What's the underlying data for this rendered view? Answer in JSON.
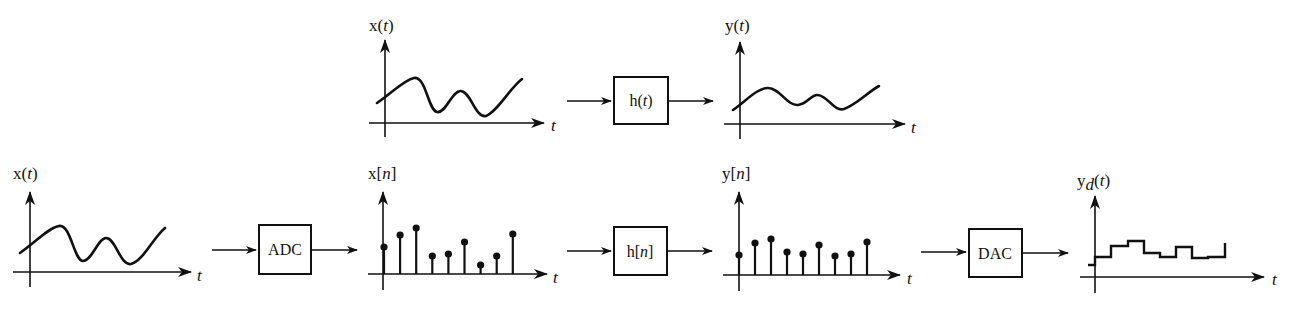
{
  "top_row": {
    "input": {
      "label_main": "x(",
      "label_var": "t",
      "label_close": ")",
      "axis_label": "t"
    },
    "system": {
      "label_main": "h(",
      "label_var": "t",
      "label_close": ")"
    },
    "output": {
      "label_main": "y(",
      "label_var": "t",
      "label_close": ")",
      "axis_label": "t"
    }
  },
  "bottom_row": {
    "input": {
      "label_main": "x(",
      "label_var": "t",
      "label_close": ")",
      "axis_label": "t"
    },
    "adc": {
      "label": "ADC"
    },
    "sampled": {
      "label_main": "x[",
      "label_var": "n",
      "label_close": "]",
      "axis_label": "t",
      "samples": [
        0.27,
        0.39,
        0.46,
        0.18,
        0.2,
        0.32,
        0.09,
        0.18,
        0.4
      ]
    },
    "system": {
      "label_main": "h[",
      "label_var": "n",
      "label_close": "]"
    },
    "filtered": {
      "label_main": "y[",
      "label_var": "n",
      "label_close": "]",
      "axis_label": "t",
      "samples": [
        0.2,
        0.32,
        0.36,
        0.23,
        0.21,
        0.3,
        0.19,
        0.21,
        0.33
      ]
    },
    "dac": {
      "label": "DAC"
    },
    "output": {
      "label_main": "y",
      "label_sub": "d",
      "label_open": "(",
      "label_var": "t",
      "label_close": ")",
      "axis_label": "t",
      "levels": [
        0.12,
        0.2,
        0.31,
        0.36,
        0.24,
        0.2,
        0.3,
        0.19,
        0.2,
        0.34
      ]
    }
  }
}
